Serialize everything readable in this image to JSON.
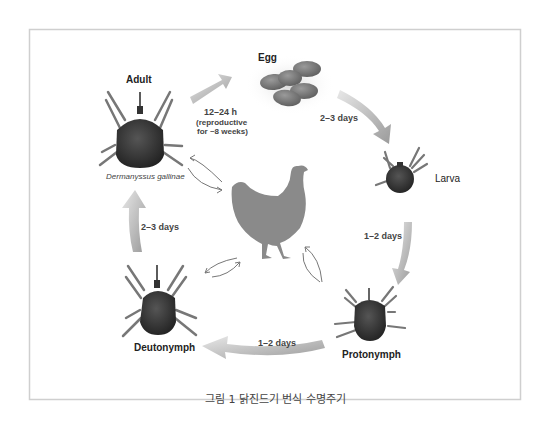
{
  "figure": {
    "caption": "그림 1 닭진드기 번식 수명주기",
    "species": "Dermanyssus gallinae",
    "stages": {
      "egg": "Egg",
      "larva": "Larva",
      "protonymph": "Protonymph",
      "deutonymph": "Deutonymph",
      "adult": "Adult"
    },
    "durations": {
      "adult_to_egg": "12–24 h",
      "adult_to_egg_note_1": "(reproductive",
      "adult_to_egg_note_2": "for ~8 weeks)",
      "egg_to_larva": "2–3 days",
      "larva_to_protonymph": "1–2 days",
      "protonymph_to_deutonymph": "1–2 days",
      "deutonymph_to_adult": "2–3 days"
    },
    "host": "chicken",
    "colors": {
      "border": "#cfcfcf",
      "arrow": "#a8a8a8",
      "mite_body": "#3a3a3a",
      "chicken": "#8a8a8a",
      "egg": "#7a7a7a"
    }
  }
}
